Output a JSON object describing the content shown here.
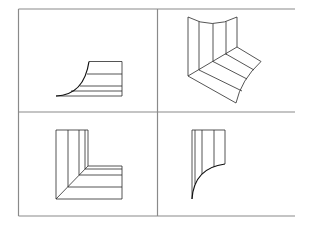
{
  "diagram": {
    "type": "2x2 grid of line-drawn surface projections",
    "grid": {
      "left": 18.5,
      "top": 9,
      "right": 295,
      "bottom": 216,
      "mid_x": 157.5,
      "mid_y": 112,
      "right_border": false,
      "color": "#8a8a8a"
    },
    "panels": [
      {
        "id": "top-left",
        "description": "side view: rectangular strip with a concave curved edge sweeping to the left"
      },
      {
        "id": "top-right",
        "description": "isometric view: L-shaped curved surface with vertical and diagonal rulings"
      },
      {
        "id": "bottom-left",
        "description": "top view: L-shaped outline with diagonal mitre and parallel rulings"
      },
      {
        "id": "bottom-right",
        "description": "front view: vertical strips ending in a concave curve"
      }
    ],
    "stroke_color": "#2a2a2a"
  }
}
